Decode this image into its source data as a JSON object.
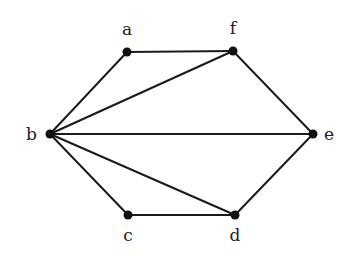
{
  "diagram": {
    "type": "undirected-graph",
    "nodes": [
      {
        "id": "a",
        "label": "a",
        "x": 127,
        "y": 52,
        "lx": 127,
        "ly": 35,
        "anchor": "middle"
      },
      {
        "id": "f",
        "label": "f",
        "x": 233,
        "y": 51,
        "lx": 233,
        "ly": 34,
        "anchor": "middle"
      },
      {
        "id": "b",
        "label": "b",
        "x": 50,
        "y": 134,
        "lx": 37,
        "ly": 140,
        "anchor": "end"
      },
      {
        "id": "e",
        "label": "e",
        "x": 313,
        "y": 134,
        "lx": 324,
        "ly": 140,
        "anchor": "start"
      },
      {
        "id": "c",
        "label": "c",
        "x": 128,
        "y": 215,
        "lx": 128,
        "ly": 241,
        "anchor": "middle"
      },
      {
        "id": "d",
        "label": "d",
        "x": 235,
        "y": 215,
        "lx": 235,
        "ly": 241,
        "anchor": "middle"
      }
    ],
    "edges": [
      [
        "a",
        "f"
      ],
      [
        "a",
        "b"
      ],
      [
        "b",
        "f"
      ],
      [
        "f",
        "e"
      ],
      [
        "b",
        "e"
      ],
      [
        "b",
        "d"
      ],
      [
        "b",
        "c"
      ],
      [
        "c",
        "d"
      ],
      [
        "d",
        "e"
      ]
    ]
  }
}
